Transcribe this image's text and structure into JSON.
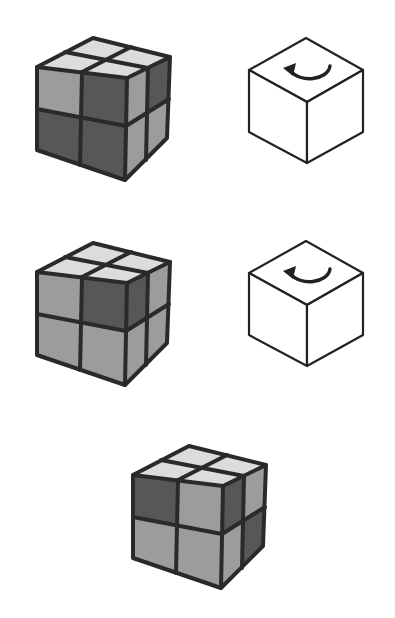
{
  "figure": {
    "colors": {
      "light": "#dcdcdc",
      "mid": "#9c9c9c",
      "dark": "#575757",
      "line": "#2a2a2a"
    },
    "rows": [
      {
        "cube": {
          "top": [
            "light",
            "light",
            "light",
            "light"
          ],
          "front": [
            "mid",
            "dark",
            "dark",
            "dark"
          ],
          "right": [
            "mid",
            "dark",
            "mid",
            "mid"
          ]
        },
        "move": {
          "icon": "rotate-top-counterclockwise-icon"
        }
      },
      {
        "cube": {
          "top": [
            "light",
            "light",
            "light",
            "light"
          ],
          "front": [
            "mid",
            "dark",
            "mid",
            "mid"
          ],
          "right": [
            "dark",
            "mid",
            "mid",
            "mid"
          ]
        },
        "move": {
          "icon": "rotate-top-counterclockwise-icon"
        }
      }
    ],
    "result": {
      "cube": {
        "top": [
          "light",
          "light",
          "light",
          "light"
        ],
        "front": [
          "dark",
          "mid",
          "mid",
          "mid"
        ],
        "right": [
          "dark",
          "mid",
          "mid",
          "dark"
        ]
      }
    }
  }
}
